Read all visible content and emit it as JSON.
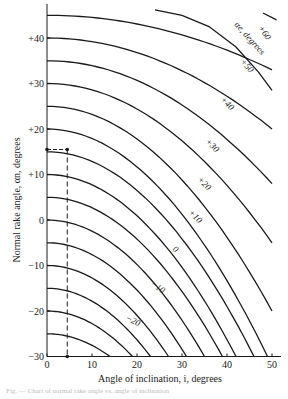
{
  "chart_data": {
    "type": "line",
    "title": "",
    "xlabel": "Angle of inclination, i, degrees",
    "ylabel": "Normal rake angle, αn, degrees",
    "xlim": [
      0,
      52
    ],
    "ylim": [
      -30,
      47
    ],
    "x_ticks": [
      "0",
      "10",
      "20",
      "30",
      "40",
      "50"
    ],
    "y_ticks": [
      "+40",
      "+30",
      "+20",
      "+10",
      "0",
      "−10",
      "−20",
      "−30"
    ],
    "grid": false,
    "legend": "inline curve labels",
    "parameter_label": "αe, degrees",
    "series": [
      {
        "name": "αe = -25",
        "start_alpha_n": -25,
        "end_i_at_alpha_min": 14
      },
      {
        "name": "αe = -20",
        "start_alpha_n": -20,
        "end_i_at_alpha_min": 19,
        "label": "−20"
      },
      {
        "name": "αe = -15",
        "start_alpha_n": -15,
        "end_i_at_alpha_min": 23
      },
      {
        "name": "αe = -10",
        "start_alpha_n": -10,
        "end_i_at_alpha_min": 27,
        "label": "−10"
      },
      {
        "name": "αe = -5",
        "start_alpha_n": -5,
        "end_i_at_alpha_min": 31
      },
      {
        "name": "αe = 0",
        "start_alpha_n": 0,
        "end_i_at_alpha_min": 35,
        "label": "0"
      },
      {
        "name": "αe = 5",
        "start_alpha_n": 5,
        "end_i_at_alpha_min": 39
      },
      {
        "name": "αe = 10",
        "start_alpha_n": 10,
        "end_i_at_alpha_min": 42,
        "label": "+10"
      },
      {
        "name": "αe = 15",
        "start_alpha_n": 15,
        "end_i_at_alpha_min": 46
      },
      {
        "name": "αe = 20",
        "start_alpha_n": 20,
        "end_i_at_alpha_min": 49,
        "label": "+20"
      },
      {
        "name": "αe = 25",
        "start_alpha_n": 25,
        "end_alpha_at_i50": -20
      },
      {
        "name": "αe = 30",
        "start_alpha_n": 30,
        "end_alpha_at_i50": -5,
        "label": "+30"
      },
      {
        "name": "αe = 35",
        "start_alpha_n": 35,
        "end_alpha_at_i50": 8
      },
      {
        "name": "αe = 40",
        "start_alpha_n": 40,
        "end_alpha_at_i50": 20,
        "label": "+40"
      },
      {
        "name": "αe = 45",
        "start_alpha_n": 45,
        "end_alpha_at_i50": 33
      },
      {
        "name": "αe = 50",
        "start_i": 25,
        "start_alpha_n": 46,
        "end_alpha_at_i50": 45,
        "label": "+50"
      },
      {
        "name": "αe = 60",
        "start_i": 49,
        "start_alpha_n": 42,
        "end_i": 51,
        "label": "+60"
      }
    ],
    "annotation": {
      "type": "dashed-guide",
      "point_i": 4.5,
      "point_alpha_n": 15.5,
      "description": "dashed lines from y-axis at αn≈15.5 to i≈4.5, then down to x-axis"
    }
  },
  "labels": {
    "xlabel": "Angle of inclination, i, degrees",
    "ylabel": "Normal rake angle, αn, degrees",
    "param": "αe, degrees",
    "caption": "Fig. — Chart of normal rake angle vs. angle of inclination"
  }
}
